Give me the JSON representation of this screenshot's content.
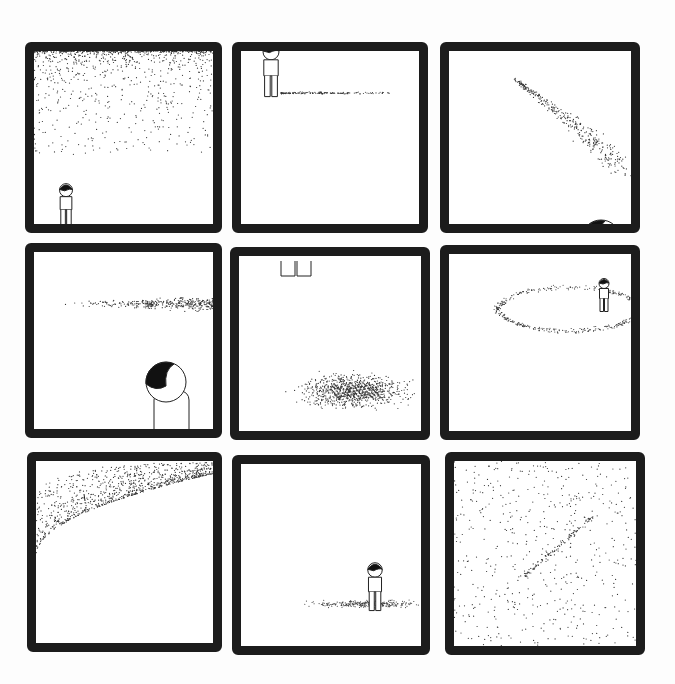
{
  "comic": {
    "layout": "3x3 grid",
    "text": "",
    "colors": {
      "ink": "#1c1c1c",
      "paper": "#ffffff",
      "background": "#fdfdfd"
    },
    "panels": [
      {
        "id": 1,
        "box": [
          25,
          42,
          197,
          191
        ],
        "content": "dense dots fill top of panel; small figure stands bottom-left looking up"
      },
      {
        "id": 2,
        "box": [
          232,
          42,
          196,
          191
        ],
        "content": "figure at top-left edge; faint trail of dots to the right"
      },
      {
        "id": 3,
        "box": [
          440,
          42,
          200,
          191
        ],
        "content": "curved streak of dots descending; large head at bottom right looking up"
      },
      {
        "id": 4,
        "box": [
          25,
          243,
          197,
          195
        ],
        "content": "horizontal band of dots from right; close-up of figure looking up at bottom"
      },
      {
        "id": 5,
        "box": [
          230,
          247,
          200,
          193
        ],
        "content": "only feet visible at top; large oval cloud of dots below"
      },
      {
        "id": 6,
        "box": [
          440,
          245,
          200,
          195
        ],
        "content": "small figure upper right; elliptical swirl of dots around"
      },
      {
        "id": 7,
        "box": [
          27,
          452,
          195,
          200
        ],
        "content": "large arc of dots sweeping across top; tiny dark mark upper-left"
      },
      {
        "id": 8,
        "box": [
          232,
          455,
          198,
          200
        ],
        "content": "figure standing on a patch of scattered dots"
      },
      {
        "id": 9,
        "box": [
          445,
          452,
          200,
          203
        ],
        "content": "evenly scattered dots with faint diagonal streak in middle"
      }
    ]
  }
}
